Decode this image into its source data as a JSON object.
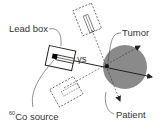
{
  "labels": {
    "lead_box": "Lead box",
    "gamma_rays": "γs",
    "tumor": "Tumor",
    "patient": "Patient",
    "source_isotope_mass": "60",
    "source_name": "Co source"
  },
  "colors": {
    "patient_fill": "#8a8a8a",
    "tumor_dot": "#111111",
    "line": "#222222",
    "text": "#333333"
  }
}
